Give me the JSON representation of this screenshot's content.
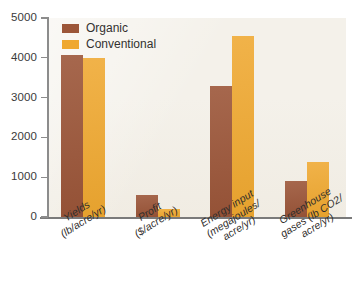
{
  "chart_data": {
    "type": "bar",
    "title": "",
    "subtitle": "",
    "xlabel": "",
    "ylabel": "",
    "ylim": [
      0,
      5000
    ],
    "y_ticks": [
      0,
      1000,
      2000,
      3000,
      4000,
      5000
    ],
    "y_tick_labels": [
      "0",
      "1000",
      "2000",
      "3000",
      "4000",
      "5000"
    ],
    "grid": false,
    "legend_position": "top-left",
    "categories": [
      "Yields (lb/acre/yr)",
      "Profit ($/acre/yr)",
      "Energy input (megajoules/acre/yr)",
      "Greenhouse gases (lb CO2/acre/yr)"
    ],
    "category_label_lines": [
      [
        "Yields",
        "(lb/acre/yr)"
      ],
      [
        "Profit",
        "($/acre/yr)"
      ],
      [
        "Energy input",
        "(megajoules/",
        "acre/yr)"
      ],
      [
        "Greenhouse",
        "gases (lb CO2/",
        "acre/yr)"
      ]
    ],
    "series": [
      {
        "name": "Organic",
        "color": "#9c5639",
        "values": [
          4075,
          550,
          3300,
          900
        ]
      },
      {
        "name": "Conventional",
        "color": "#efa830",
        "values": [
          4000,
          190,
          4550,
          1380
        ]
      }
    ]
  },
  "legend": {
    "items": [
      {
        "label": "Organic",
        "color": "#9c5639"
      },
      {
        "label": "Conventional",
        "color": "#efa830"
      }
    ]
  },
  "axes": {
    "y_tick_labels": [
      "5000",
      "4000",
      "3000",
      "2000",
      "1000",
      "0"
    ],
    "axis_color": "#8c8c8c"
  },
  "colors": {
    "organic": "#9c5639",
    "conventional": "#efa830",
    "plot_background": "#f4f1ea",
    "page_background": "#ffffff",
    "axis": "#8c8c8c",
    "text": "#2f2d2b"
  },
  "caption_remnant": ""
}
